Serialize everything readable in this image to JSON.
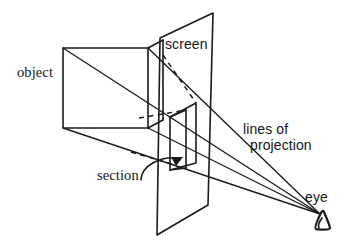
{
  "figure": {
    "kind": "technical-line-diagram",
    "width": 355,
    "height": 248,
    "background_color": "#ffffff",
    "ink_color": "#1a1a1a"
  },
  "labels": {
    "object": "object",
    "screen": "screen",
    "section": "section",
    "lines_of_projection_line1": "lines of",
    "lines_of_projection_line2": "projection",
    "lines_of_projection_full": "lines of projection",
    "eye": "eye"
  },
  "icons": {
    "eye_glyph": "eye-icon",
    "section_arrow": "arrowhead-icon"
  },
  "geometry": {
    "object_cube": {
      "front_face": [
        [
          63,
          48
        ],
        [
          148,
          48
        ],
        [
          148,
          128
        ],
        [
          63,
          128
        ]
      ],
      "top_back_edge": [
        [
          148,
          48
        ],
        [
          163,
          40
        ]
      ],
      "right_back_edge": [
        [
          148,
          128
        ],
        [
          163,
          120
        ]
      ],
      "diagonal_front": [
        [
          63,
          48
        ],
        [
          148,
          128
        ]
      ]
    },
    "screen_plane": {
      "corners": [
        [
          160,
          38
        ],
        [
          213,
          13
        ],
        [
          208,
          205
        ],
        [
          157,
          235
        ]
      ]
    },
    "section_quad": {
      "corners": [
        [
          170,
          117
        ],
        [
          196,
          103
        ],
        [
          196,
          163
        ],
        [
          170,
          170
        ]
      ],
      "inner_vertical": [
        [
          186,
          110
        ],
        [
          186,
          168
        ]
      ]
    },
    "eye_point": [
      320,
      214
    ],
    "projection_lines": [
      [
        [
          63,
          48
        ],
        [
          320,
          214
        ]
      ],
      [
        [
          148,
          48
        ],
        [
          320,
          214
        ]
      ],
      [
        [
          63,
          128
        ],
        [
          320,
          214
        ]
      ],
      [
        [
          148,
          128
        ],
        [
          320,
          214
        ]
      ]
    ],
    "dashed_lines": [
      [
        [
          163,
          55
        ],
        [
          196,
          103
        ]
      ],
      [
        [
          141,
          118
        ],
        [
          186,
          110
        ]
      ],
      [
        [
          133,
          150
        ],
        [
          176,
          165
        ]
      ]
    ],
    "section_leader": {
      "from": [
        141,
        176
      ],
      "arrow_tip": [
        182,
        158
      ]
    }
  }
}
